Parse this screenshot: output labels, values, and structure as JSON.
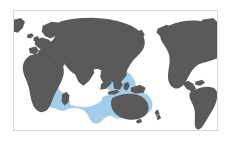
{
  "figure": {
    "type": "distribution-range-map",
    "title": "",
    "caption": "",
    "projection": "equirectangular-pacific-split",
    "center_longitude": 90,
    "frame": {
      "x": 13,
      "y": 10,
      "width": 205,
      "height": 121,
      "border_color": "#d8d8d8",
      "border_width": 1
    },
    "background_color": "#ffffff"
  },
  "legend": {
    "visible": false,
    "entries": [
      {
        "label": "Distribution range",
        "color": "#a3cdeb"
      },
      {
        "label": "Land",
        "color": "#5a5a5a"
      }
    ]
  },
  "colors": {
    "land": "#5a5a5a",
    "land_outline": "#5a5a5a",
    "range_fill": "#a3cdeb",
    "range_stroke": "#8ec0e2",
    "ocean": "#ffffff",
    "frame": "#d8d8d8",
    "page": "#ffffff"
  },
  "range_regions": [
    "Red Sea",
    "Persian Gulf",
    "Arabian Sea",
    "Bay of Bengal",
    "Indian Ocean",
    "Madagascar / East African coast",
    "Andaman Sea",
    "South China Sea",
    "Indonesian archipelago",
    "Philippine Sea",
    "Coral Sea",
    "Northern Australia coast",
    "Western Pacific islands"
  ],
  "landmasses": [
    "Europe",
    "Africa",
    "Asia",
    "Australia",
    "North America",
    "South America",
    "Greenland"
  ],
  "axes": {
    "visible": false,
    "x_ticks": [],
    "y_ticks": [],
    "grid": false
  }
}
